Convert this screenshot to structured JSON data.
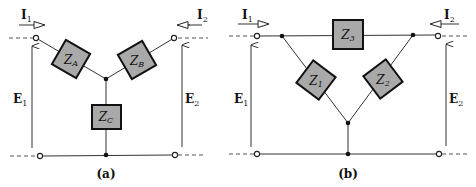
{
  "figure": {
    "panels": [
      {
        "id": "a",
        "caption": "(a)",
        "type": "wye (T) network",
        "impedances": [
          {
            "name": "Z",
            "sub": "A"
          },
          {
            "name": "Z",
            "sub": "B"
          },
          {
            "name": "Z",
            "sub": "C"
          }
        ],
        "currents": [
          {
            "name": "I",
            "sub": "1",
            "direction": "right"
          },
          {
            "name": "I",
            "sub": "2",
            "direction": "left"
          }
        ],
        "voltages": [
          {
            "name": "E",
            "sub": "1"
          },
          {
            "name": "E",
            "sub": "2"
          }
        ]
      },
      {
        "id": "b",
        "caption": "(b)",
        "type": "delta (pi) network",
        "impedances": [
          {
            "name": "Z",
            "sub": "1"
          },
          {
            "name": "Z",
            "sub": "2"
          },
          {
            "name": "Z",
            "sub": "3"
          }
        ],
        "currents": [
          {
            "name": "I",
            "sub": "1",
            "direction": "right"
          },
          {
            "name": "I",
            "sub": "2",
            "direction": "left"
          }
        ],
        "voltages": [
          {
            "name": "E",
            "sub": "1"
          },
          {
            "name": "E",
            "sub": "2"
          }
        ]
      }
    ],
    "colors": {
      "impedance_fill": "#a9a9a9",
      "impedance_border": "#111111",
      "wire": "#333333",
      "background": "#ffffff"
    }
  }
}
